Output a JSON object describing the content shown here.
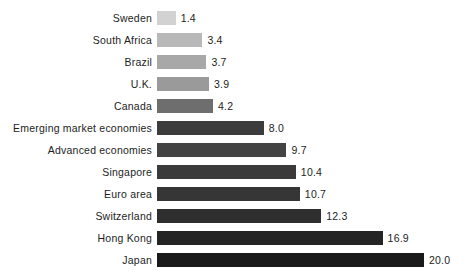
{
  "chart_data": {
    "type": "bar",
    "orientation": "horizontal",
    "title": "",
    "subtitle": "",
    "xlabel": "",
    "ylabel": "",
    "xlim": [
      0,
      20.0
    ],
    "grid": false,
    "legend": false,
    "axis_visible": false,
    "value_labels": true,
    "categories": [
      "Sweden",
      "South Africa",
      "Brazil",
      "U.K.",
      "Canada",
      "Emerging market economies",
      "Advanced economies",
      "Singapore",
      "Euro area",
      "Switzerland",
      "Hong Kong",
      "Japan"
    ],
    "values": [
      1.4,
      3.4,
      3.7,
      3.9,
      4.2,
      8.0,
      9.7,
      10.4,
      10.7,
      12.3,
      16.9,
      20.0
    ],
    "value_labels_text": [
      "1.4",
      "3.4",
      "3.7",
      "3.9",
      "4.2",
      "8.0",
      "9.7",
      "10.4",
      "10.7",
      "12.3",
      "16.9",
      "20.0"
    ],
    "bar_colors": [
      "#d2d2d2",
      "#b8b8b8",
      "#a8a8a8",
      "#9a9a9a",
      "#6e6e6e",
      "#3c3c3c",
      "#434343",
      "#3a3a3a",
      "#363636",
      "#2e2e2e",
      "#242424",
      "#1a1a1a"
    ],
    "background_color": "#ffffff",
    "text_color": "#1d1d1d"
  },
  "layout": {
    "bar_start_x": 157,
    "label_right_x": 152,
    "first_bar_y": 11,
    "bar_pitch": 22,
    "bar_height": 14,
    "px_per_unit": 13.35
  }
}
